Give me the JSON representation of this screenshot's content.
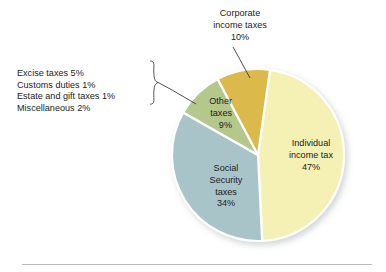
{
  "chart_data": {
    "type": "pie",
    "title": "",
    "categories": [
      "Individual income tax",
      "Social Security taxes",
      "Other taxes",
      "Corporate income taxes"
    ],
    "values": [
      47,
      34,
      9,
      10
    ],
    "unit": "percent",
    "legend_position": "none",
    "grid": false,
    "slices": [
      {
        "name": "Individual income tax",
        "value": 47,
        "value_label": "47%",
        "color": "#f5f0b4",
        "label_lines": [
          "Individual",
          "income tax",
          "47%"
        ],
        "label_placement": "inside"
      },
      {
        "name": "Social Security taxes",
        "value": 34,
        "value_label": "34%",
        "color": "#a8c4c8",
        "label_lines": [
          "Social",
          "Security",
          "taxes",
          "34%"
        ],
        "label_placement": "inside"
      },
      {
        "name": "Other taxes",
        "value": 9,
        "value_label": "9%",
        "color": "#b4c88c",
        "label_lines": [
          "Other",
          "taxes",
          "9%"
        ],
        "label_placement": "inside"
      },
      {
        "name": "Corporate income taxes",
        "value": 10,
        "value_label": "10%",
        "color": "#dcb94c",
        "label_lines": [
          "Corporate",
          "income taxes",
          "10%"
        ],
        "label_placement": "outside-callout"
      }
    ],
    "annotations": {
      "other_taxes_breakdown": [
        "Excise taxes 5%",
        "Customs duties 1%",
        "Estate and gift taxes 1%",
        "Miscellaneous 2%"
      ],
      "breakdown_brace": "curly-brace",
      "breakdown_target": "Other taxes"
    }
  },
  "colors": {
    "background": "#ffffff",
    "individual": "#f5f0b4",
    "social_security": "#a8c4c8",
    "other_taxes": "#b4c88c",
    "corporate": "#dcb94c",
    "slice_divider": "#ffffff",
    "leader_line": "#3c3c3c",
    "brace": "#555555",
    "rule": "#b9b9b9",
    "text": "#1c1c1c"
  },
  "footer": {
    "rule_present": true
  }
}
